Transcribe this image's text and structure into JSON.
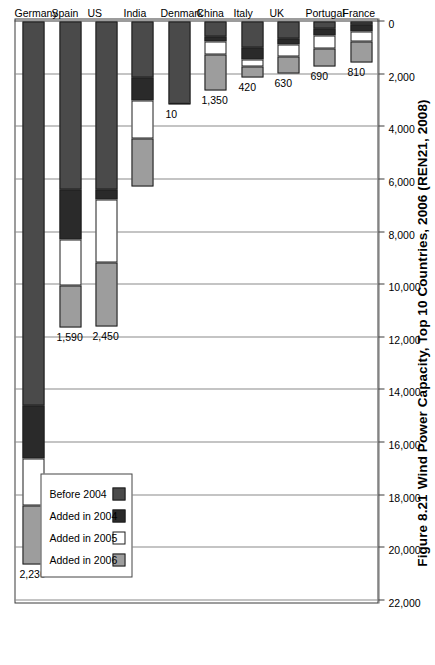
{
  "figure": {
    "number": "Figure 8.21",
    "caption": "Wind Power Capacity, Top 10 Countries, 2006 (REN21, 2008)"
  },
  "legend": {
    "position": "upper-left",
    "items": [
      {
        "label": "Added in 2006",
        "color": "#9d9d9d",
        "key": "added_2006"
      },
      {
        "label": "Added in 2005",
        "color": "#ffffff",
        "key": "added_2005"
      },
      {
        "label": "Added in 2004",
        "color": "#2a2a2a",
        "key": "added_2004"
      },
      {
        "label": "Before 2004",
        "color": "#4a4a4a",
        "key": "before_2004"
      }
    ]
  },
  "chart_data": {
    "type": "bar",
    "orientation": "horizontal",
    "stacked": true,
    "title": "Wind Power Capacity, Top 10 Countries, 2006 (REN21, 2008)",
    "xlabel": "",
    "ylabel": "",
    "xlim": [
      0,
      22000
    ],
    "grid": true,
    "legend_position": "upper-left",
    "categories": [
      "Germany",
      "Spain",
      "US",
      "India",
      "Denmark",
      "China",
      "Italy",
      "UK",
      "Portugal",
      "France"
    ],
    "tick_labels": [
      "0",
      "2,000",
      "4,000",
      "6,000",
      "8,000",
      "10,000",
      "12,000",
      "14,000",
      "16,000",
      "18,000",
      "20,000",
      "22,000"
    ],
    "tick_values": [
      0,
      2000,
      4000,
      6000,
      8000,
      10000,
      12000,
      14000,
      16000,
      18000,
      20000,
      22000
    ],
    "series": [
      {
        "name": "Before 2004",
        "color": "#4a4a4a",
        "values": [
          14590,
          6375,
          6380,
          2125,
          3126,
          560,
          1000,
          640,
          255,
          130
        ]
      },
      {
        "name": "Added in 2004",
        "color": "#2a2a2a",
        "values": [
          2020,
          1900,
          370,
          875,
          0,
          200,
          450,
          250,
          270,
          250
        ]
      },
      {
        "name": "Added in 2005",
        "color": "#ffffff",
        "values": [
          1780,
          1750,
          2400,
          1430,
          0,
          500,
          250,
          450,
          500,
          380
        ]
      },
      {
        "name": "Added in 2006",
        "color": "#9d9d9d",
        "values": [
          2230,
          1590,
          2450,
          1840,
          10,
          1350,
          420,
          630,
          690,
          810
        ]
      }
    ],
    "data_labels": {
      "series": "Added in 2006",
      "values": [
        "2,230",
        "1,590",
        "2,450",
        "",
        "10",
        "1,350",
        "420",
        "630",
        "690",
        "810"
      ]
    },
    "totals": [
      20620,
      11615,
      11600,
      6270,
      3136,
      2610,
      2120,
      1970,
      1715,
      1570
    ]
  }
}
